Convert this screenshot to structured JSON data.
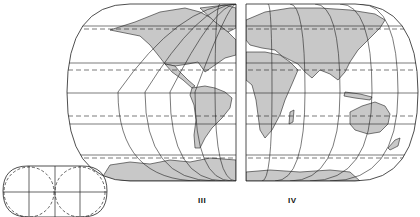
{
  "figure": {
    "panels": [
      {
        "id": "III",
        "label": "III",
        "region": "Americas (western hemisphere)"
      },
      {
        "id": "IV",
        "label": "IV",
        "region": "Europe, Africa, Asia, Australia (eastern hemisphere)"
      }
    ],
    "inset": {
      "description": "Two overlapping circles with a rounded-rectangle outline and cross grid"
    },
    "colors": {
      "land": "#c8c8c8",
      "line": "#222222",
      "background": "#ffffff"
    }
  }
}
